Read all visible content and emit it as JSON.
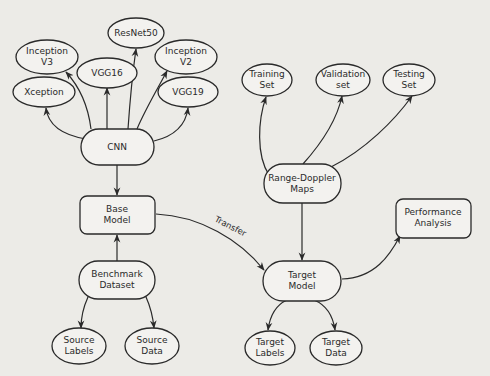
{
  "diagram": {
    "title": "",
    "nodes": [
      {
        "id": "resnet50",
        "shape": "ellipse",
        "lines": [
          "ResNet50"
        ]
      },
      {
        "id": "inceptionv3",
        "shape": "ellipse",
        "lines": [
          "Inception",
          "V3"
        ]
      },
      {
        "id": "vgg16",
        "shape": "ellipse",
        "lines": [
          "VGG16"
        ]
      },
      {
        "id": "inceptionv2",
        "shape": "ellipse",
        "lines": [
          "Inception",
          "V2"
        ]
      },
      {
        "id": "xception",
        "shape": "ellipse",
        "lines": [
          "Xception"
        ]
      },
      {
        "id": "vgg19",
        "shape": "ellipse",
        "lines": [
          "VGG19"
        ]
      },
      {
        "id": "cnn",
        "shape": "pill",
        "lines": [
          "CNN"
        ]
      },
      {
        "id": "basemodel",
        "shape": "rounded-rect",
        "lines": [
          "Base",
          "Model"
        ]
      },
      {
        "id": "benchmark",
        "shape": "pill",
        "lines": [
          "Benchmark",
          "Dataset"
        ]
      },
      {
        "id": "sourcelabels",
        "shape": "ellipse",
        "lines": [
          "Source",
          "Labels"
        ]
      },
      {
        "id": "sourcedata",
        "shape": "ellipse",
        "lines": [
          "Source",
          "Data"
        ]
      },
      {
        "id": "training",
        "shape": "ellipse",
        "lines": [
          "Training",
          "Set"
        ]
      },
      {
        "id": "validation",
        "shape": "ellipse",
        "lines": [
          "Validation",
          "set"
        ]
      },
      {
        "id": "testing",
        "shape": "ellipse",
        "lines": [
          "Testing",
          "Set"
        ]
      },
      {
        "id": "rangedoppler",
        "shape": "pill",
        "lines": [
          "Range-Doppler",
          "Maps"
        ]
      },
      {
        "id": "performance",
        "shape": "rounded-rect",
        "lines": [
          "Performance",
          "Analysis"
        ]
      },
      {
        "id": "targetmodel",
        "shape": "pill",
        "lines": [
          "Target",
          "Model"
        ]
      },
      {
        "id": "targetlabels",
        "shape": "ellipse",
        "lines": [
          "Target",
          "Labels"
        ]
      },
      {
        "id": "targetdata",
        "shape": "ellipse",
        "lines": [
          "Target",
          "Data"
        ]
      }
    ],
    "edges": [
      {
        "from": "cnn",
        "to": "xception"
      },
      {
        "from": "cnn",
        "to": "inceptionv3"
      },
      {
        "from": "cnn",
        "to": "vgg16"
      },
      {
        "from": "cnn",
        "to": "resnet50"
      },
      {
        "from": "cnn",
        "to": "inceptionv2"
      },
      {
        "from": "cnn",
        "to": "vgg19"
      },
      {
        "from": "cnn",
        "to": "basemodel"
      },
      {
        "from": "benchmark",
        "to": "basemodel"
      },
      {
        "from": "benchmark",
        "to": "sourcelabels"
      },
      {
        "from": "benchmark",
        "to": "sourcedata"
      },
      {
        "from": "basemodel",
        "to": "targetmodel",
        "label": "Transfer"
      },
      {
        "from": "rangedoppler",
        "to": "training"
      },
      {
        "from": "rangedoppler",
        "to": "validation"
      },
      {
        "from": "rangedoppler",
        "to": "testing"
      },
      {
        "from": "rangedoppler",
        "to": "targetmodel"
      },
      {
        "from": "targetmodel",
        "to": "performance"
      },
      {
        "from": "targetmodel",
        "to": "targetlabels"
      },
      {
        "from": "targetmodel",
        "to": "targetdata"
      }
    ],
    "transfer_label": "Transfer"
  }
}
